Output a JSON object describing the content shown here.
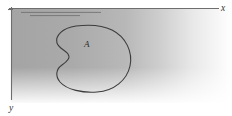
{
  "figure": {
    "kind": "math-diagram",
    "background_note": "scanned textbook page, gray gradient shading fading to white toward the right and bottom",
    "axes": {
      "x_label": "x",
      "y_label": "y",
      "x_axis_orientation": "horizontal, pointing right",
      "y_axis_orientation": "vertical, pointing down",
      "origin_corner": "top-left"
    },
    "region": {
      "label": "A",
      "shape": "kidney-shaped closed curve with a concave notch on its left side"
    },
    "hatching": {
      "count": 2,
      "orientation": "horizontal",
      "note": "short shading strokes just below the x-axis"
    },
    "colors": {
      "axis_stroke": "#6e6e6e",
      "outline_stroke": "#3c3c3c",
      "label_fill": "#333333",
      "shade_dark": "#a9a9a9",
      "shade_light": "#ffffff",
      "page_background": "#ffffff"
    }
  }
}
